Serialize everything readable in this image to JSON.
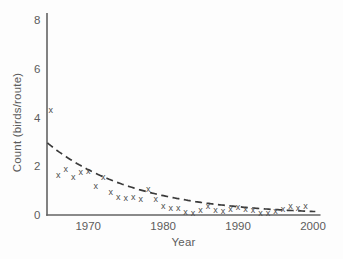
{
  "figure": {
    "background": "#fdfdfd"
  },
  "chart_data": {
    "type": "scatter",
    "title": "",
    "xlabel": "Year",
    "ylabel": "Count (birds/route)",
    "xlim": [
      1964.5,
      2001
    ],
    "ylim": [
      0,
      8.3
    ],
    "xticks": [
      1970,
      1980,
      1990,
      2000
    ],
    "yticks": [
      0,
      2,
      4,
      6,
      8
    ],
    "grid": false,
    "legend": "none",
    "marker_glyph": "x",
    "series": [
      {
        "name": "observed count (birds/route)",
        "type": "scatter",
        "points": [
          [
            1965,
            4.3
          ],
          [
            1966,
            1.65
          ],
          [
            1967,
            1.9
          ],
          [
            1968,
            1.55
          ],
          [
            1969,
            1.75
          ],
          [
            1970,
            1.8
          ],
          [
            1971,
            1.2
          ],
          [
            1972,
            1.55
          ],
          [
            1973,
            0.95
          ],
          [
            1974,
            0.75
          ],
          [
            1975,
            0.68
          ],
          [
            1976,
            0.72
          ],
          [
            1977,
            0.65
          ],
          [
            1978,
            1.05
          ],
          [
            1979,
            0.64
          ],
          [
            1980,
            0.37
          ],
          [
            1981,
            0.3
          ],
          [
            1982,
            0.3
          ],
          [
            1983,
            0.12
          ],
          [
            1984,
            0.09
          ],
          [
            1985,
            0.2
          ],
          [
            1986,
            0.37
          ],
          [
            1987,
            0.2
          ],
          [
            1988,
            0.16
          ],
          [
            1989,
            0.26
          ],
          [
            1990,
            0.34
          ],
          [
            1991,
            0.25
          ],
          [
            1992,
            0.21
          ],
          [
            1993,
            0.1
          ],
          [
            1994,
            0.08
          ],
          [
            1995,
            0.15
          ],
          [
            1996,
            0.24
          ],
          [
            1997,
            0.35
          ],
          [
            1998,
            0.3
          ],
          [
            1999,
            0.39
          ]
        ]
      },
      {
        "name": "fitted exponential decline trend (dashed)",
        "type": "dashed-line",
        "model": "count = 2.85 * exp(-0.085 * (year - 1965))",
        "x_start": 1964.55,
        "x_end": 2000.4,
        "y_at_1965": 2.85,
        "decay_rate_per_year": 0.085
      }
    ],
    "colors": {
      "marker": "#4d4d4d",
      "trend": "#3a3a3a",
      "axis": "#636363",
      "tick_label": "#5c5c5c",
      "axis_label": "#5c5c5c"
    }
  }
}
